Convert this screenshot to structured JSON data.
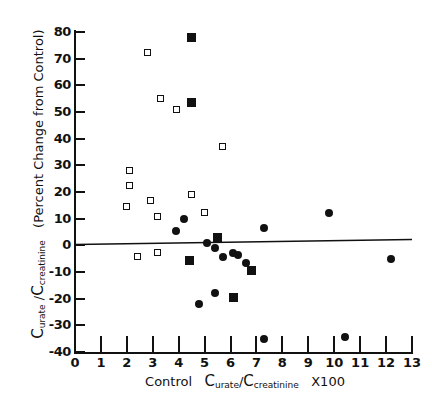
{
  "chart_data": {
    "type": "scatter",
    "title": "",
    "xlabel": "Control Curate/Ccreatinine X100",
    "ylabel": "Curate/Ccreatinine (Percent Change from Control)",
    "xlim": [
      0,
      13
    ],
    "ylim": [
      -40,
      80
    ],
    "xticks": [
      0,
      1,
      2,
      3,
      4,
      5,
      6,
      7,
      8,
      9,
      10,
      11,
      12,
      13
    ],
    "yticks": [
      -40,
      -30,
      -20,
      -10,
      0,
      10,
      20,
      30,
      40,
      50,
      60,
      70,
      80
    ],
    "xtick_labels": [
      "0",
      "1",
      "2",
      "3",
      "4",
      "5",
      "6",
      "7",
      "8",
      "9",
      "10",
      "11",
      "12",
      "13"
    ],
    "ytick_labels": [
      "-40",
      "-30",
      "-20",
      "-10",
      "0",
      "10",
      "20",
      "30",
      "40",
      "50",
      "60",
      "70",
      "80"
    ],
    "grid": false,
    "legend": "none",
    "series": [
      {
        "name": "open-square",
        "marker": "open square",
        "color": "#111111",
        "points": [
          {
            "x": 2.8,
            "y": 72.5
          },
          {
            "x": 3.3,
            "y": 55.0
          },
          {
            "x": 3.9,
            "y": 51.0
          },
          {
            "x": 5.7,
            "y": 37.0
          },
          {
            "x": 2.1,
            "y": 28.0
          },
          {
            "x": 2.1,
            "y": 22.5
          },
          {
            "x": 2.9,
            "y": 17.0
          },
          {
            "x": 4.5,
            "y": 19.0
          },
          {
            "x": 2.0,
            "y": 14.5
          },
          {
            "x": 3.2,
            "y": 11.0
          },
          {
            "x": 5.0,
            "y": 12.5
          },
          {
            "x": 2.4,
            "y": -4.0
          },
          {
            "x": 3.2,
            "y": -2.5
          }
        ]
      },
      {
        "name": "filled-square",
        "marker": "filled square",
        "color": "#111111",
        "points": [
          {
            "x": 4.5,
            "y": 78.0
          },
          {
            "x": 4.5,
            "y": 53.5
          },
          {
            "x": 5.5,
            "y": 3.0
          },
          {
            "x": 4.4,
            "y": -5.5
          },
          {
            "x": 6.8,
            "y": -9.5
          },
          {
            "x": 6.1,
            "y": -19.5
          }
        ]
      },
      {
        "name": "filled-circle",
        "marker": "filled circle",
        "color": "#111111",
        "points": [
          {
            "x": 9.8,
            "y": 12.0
          },
          {
            "x": 4.2,
            "y": 10.0
          },
          {
            "x": 7.3,
            "y": 6.5
          },
          {
            "x": 3.9,
            "y": 5.5
          },
          {
            "x": 5.1,
            "y": 1.0
          },
          {
            "x": 5.4,
            "y": -1.0
          },
          {
            "x": 6.1,
            "y": -3.0
          },
          {
            "x": 6.3,
            "y": -3.5
          },
          {
            "x": 5.7,
            "y": -4.5
          },
          {
            "x": 6.6,
            "y": -6.5
          },
          {
            "x": 12.2,
            "y": -5.0
          },
          {
            "x": 5.4,
            "y": -18.0
          },
          {
            "x": 4.8,
            "y": -22.0
          },
          {
            "x": 7.3,
            "y": -35.0
          },
          {
            "x": 10.4,
            "y": -34.5
          }
        ]
      }
    ],
    "fit_line": {
      "name": "regression-line",
      "x_start": 0,
      "y_start": 0.3,
      "x_end": 13,
      "y_end": 2.2
    }
  },
  "axis_titles": {
    "x_prefix": "Control",
    "x_c": "C",
    "x_sub1": "urate",
    "x_slash": "/",
    "x_c2": "C",
    "x_sub2": "creatinine",
    "x_suffix": "X100",
    "y_c": "C",
    "y_sub1": "urate",
    "y_slash": "/",
    "y_c2": "C",
    "y_sub2": "creatinine",
    "y_paren": "(Percent Change from Control)"
  }
}
